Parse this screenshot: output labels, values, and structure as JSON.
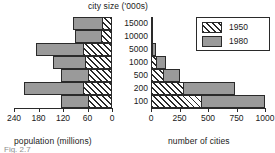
{
  "chart_data": {
    "type": "bar",
    "title": "city size ('000s)",
    "orientation": "horizontal",
    "layout": "back-to-back population pyramid, two panels sharing category axis",
    "grid": false,
    "categories": [
      "15000",
      "10000",
      "5000",
      "1000",
      "500",
      "200",
      "100"
    ],
    "category_axis_label": "city size ('000s)",
    "legend": {
      "position": "top-right",
      "entries": [
        {
          "name": "1950",
          "fill": "hatched-diagonal"
        },
        {
          "name": "1980",
          "fill": "solid-gray"
        }
      ]
    },
    "panels": [
      {
        "id": "population",
        "side": "left",
        "xlabel": "population (millions)",
        "xticks": [
          240,
          180,
          120,
          60,
          0
        ],
        "xlim": [
          240,
          0
        ],
        "direction": "right-to-left",
        "series": [
          {
            "name": "1950",
            "values": [
              25,
              28,
              70,
              65,
              60,
              72,
              58
            ]
          },
          {
            "name": "1980",
            "values": [
              95,
              90,
              185,
              145,
              125,
              215,
              125
            ]
          }
        ]
      },
      {
        "id": "cities",
        "side": "right",
        "xlabel": "number of cities",
        "xticks": [
          0,
          250,
          500,
          750,
          1000
        ],
        "xlim": [
          0,
          1000
        ],
        "direction": "left-to-right",
        "series": [
          {
            "name": "1950",
            "values": [
              2,
              7,
              20,
              55,
              115,
              290,
              445
            ]
          },
          {
            "name": "1980",
            "values": [
              5,
              14,
              45,
              130,
              250,
              735,
              1000
            ]
          }
        ]
      }
    ],
    "colors": {
      "bar_1980": "#9a9a9a",
      "bar_1950": "#ffffff",
      "outline": "#2a2a2a",
      "text": "#1a1a1a",
      "background": "#ffffff"
    }
  },
  "caption": "Fig. 2.7"
}
